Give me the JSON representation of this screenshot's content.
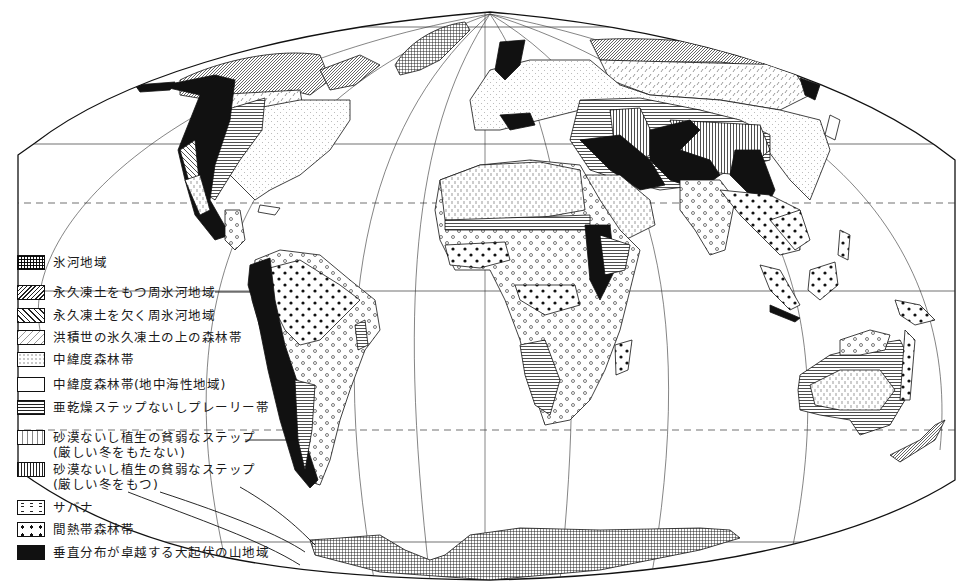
{
  "map": {
    "projection": "Mollweide-like pseudo-cylindrical world projection",
    "frame_color": "#111111",
    "graticule": {
      "parallels_solid": [
        "60N",
        "equator",
        "60S"
      ],
      "parallels_dashed": [
        "Tropic of Cancer",
        "Tropic of Capricorn"
      ],
      "meridians_curved": true
    },
    "regions_shown": [
      "North America",
      "South America",
      "Europe",
      "Africa",
      "Asia",
      "Australia",
      "Antarctica",
      "Greenland",
      "New Zealand",
      "Madagascar",
      "Indonesia",
      "Japan"
    ]
  },
  "legend": {
    "items": [
      {
        "id": "glacier",
        "pattern": "grid",
        "label": "氷河地域"
      },
      {
        "id": "periglacial-permafrost",
        "pattern": "dense-diagonal",
        "label": "永久凍土をもつ周氷河地域"
      },
      {
        "id": "periglacial-no-permafrost",
        "pattern": "sparse-diagonal",
        "label": "永久凍土を欠く周氷河地域"
      },
      {
        "id": "pleistocene-permafrost-forest",
        "pattern": "diagonal-dashes",
        "label": "洪積世の氷久凍土の上の森林帯"
      },
      {
        "id": "midlatitude-forest",
        "pattern": "fine-dots",
        "label": "中緯度森林帯"
      },
      {
        "id": "midlatitude-forest-mediterranean",
        "pattern": "blank",
        "label": "中緯度森林帯(地中海性地域)"
      },
      {
        "id": "semiarid-steppe-prairie",
        "pattern": "horizontal-lines",
        "label": "亜乾燥ステップないしプレーリー帯"
      },
      {
        "id": "desert-steppe-mild-winter",
        "pattern": "vertical-dashes",
        "label_line1": "砂漠ないし植生の貧弱なステップ",
        "label_line2": "(厳しい冬をもたない)"
      },
      {
        "id": "desert-steppe-harsh-winter",
        "pattern": "vertical-lines",
        "label_line1": "砂漠ないし植生の貧弱なステップ",
        "label_line2": "(厳しい冬をもつ)"
      },
      {
        "id": "savanna",
        "pattern": "open-circles",
        "label": "サバナ"
      },
      {
        "id": "intertropical-forest",
        "pattern": "filled-dots",
        "label": "間熱帯森林帯"
      },
      {
        "id": "high-relief-mountain",
        "pattern": "solid-black",
        "label": "垂直分布が卓越する大起伏の山地域"
      }
    ]
  }
}
